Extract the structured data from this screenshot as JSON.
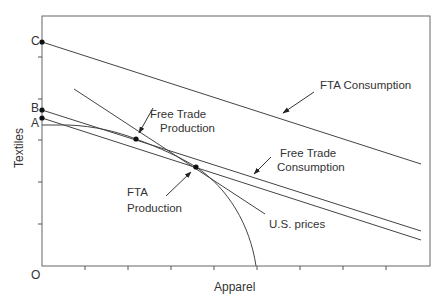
{
  "diagram": {
    "type": "production-possibility / trade diagram",
    "x_axis_label": "Apparel",
    "y_axis_label": "Textiles",
    "origin_label": "O",
    "intercept_labels": {
      "C": "C",
      "B": "B",
      "A": "A"
    },
    "annotations": {
      "fta_consumption": "FTA  Consumption",
      "free_trade_production_line1": "Free Trade",
      "free_trade_production_line2": "Production",
      "free_trade_consumption_line1": "Free Trade",
      "free_trade_consumption_line2": "Consumption",
      "fta_production_line1": "FTA",
      "fta_production_line2": "Production",
      "us_prices": "U.S. prices"
    },
    "elements": [
      {
        "name": "budget-line-C",
        "from_intercept": "C"
      },
      {
        "name": "budget-line-B",
        "from_intercept": "B"
      },
      {
        "name": "budget-line-A",
        "from_intercept": "A"
      },
      {
        "name": "us-prices-line"
      },
      {
        "name": "production-possibility-frontier"
      }
    ],
    "colors": {
      "line": "#444444",
      "text": "#333333",
      "background": "#ffffff"
    }
  }
}
